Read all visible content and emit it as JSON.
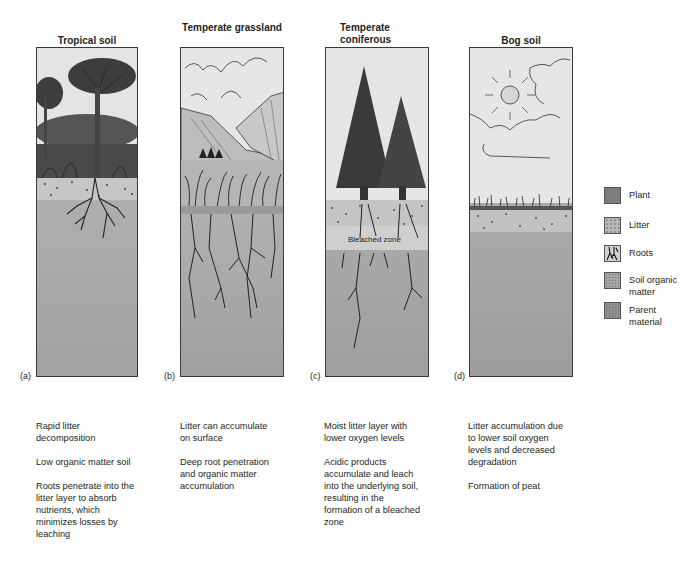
{
  "panels": [
    {
      "id": "a",
      "title": "Tropical soil",
      "letter": "(a)",
      "descriptions": [
        "Rapid litter decomposition",
        "Low organic matter soil",
        "Roots penetrate into the litter layer to absorb nutrients, which minimizes losses by leaching"
      ]
    },
    {
      "id": "b",
      "title": "Temperate grassland",
      "letter": "(b)",
      "descriptions": [
        "Litter can accumulate on surface",
        "Deep root penetration and organic matter accumulation"
      ]
    },
    {
      "id": "c",
      "title": "Temperate coniferous",
      "letter": "(c)",
      "annotation": "Bleached zone",
      "descriptions": [
        "Moist litter layer with lower oxygen levels",
        "Acidic products accumulate and leach into the underlying soil, resulting in the formation of a bleached zone"
      ]
    },
    {
      "id": "d",
      "title": "Bog soil",
      "letter": "(d)",
      "descriptions": [
        "Litter accumulation due to lower soil oxygen levels and decreased degradation",
        "Formation of peat"
      ]
    }
  ],
  "legend": [
    {
      "label": "Plant",
      "icon": "plant-swatch",
      "color": "#7d7d7d"
    },
    {
      "label": "Litter",
      "icon": "litter-swatch",
      "color": "#b8b8b8"
    },
    {
      "label": "Roots",
      "icon": "roots-swatch",
      "color": "#d0d0d0"
    },
    {
      "label": "Soil organic matter",
      "icon": "soil-organic-matter-swatch",
      "color": "#a4a4a4"
    },
    {
      "label": "Parent material",
      "icon": "parent-material-swatch",
      "color": "#8f8f8f"
    }
  ],
  "colors": {
    "sky": "#e6e6e6",
    "soil_light": "#b3b3b3",
    "soil_dark": "#9c9c9c",
    "plant": "#3f3f3f"
  }
}
